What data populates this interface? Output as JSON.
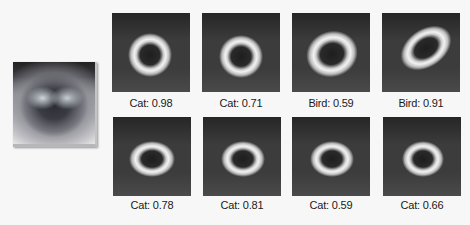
{
  "input_image": {
    "description": "cat face photo",
    "icon": "cat-photo"
  },
  "heatmaps": {
    "top_row": [
      {
        "label": "Cat: 0.98",
        "class": "Cat",
        "score": 0.98
      },
      {
        "label": "Cat: 0.71",
        "class": "Cat",
        "score": 0.71
      },
      {
        "label": "Bird: 0.59",
        "class": "Bird",
        "score": 0.59
      },
      {
        "label": "Bird: 0.91",
        "class": "Bird",
        "score": 0.91
      }
    ],
    "bottom_row": [
      {
        "label": "Cat: 0.78",
        "class": "Cat",
        "score": 0.78
      },
      {
        "label": "Cat: 0.81",
        "class": "Cat",
        "score": 0.81
      },
      {
        "label": "Cat: 0.59",
        "class": "Cat",
        "score": 0.59
      },
      {
        "label": "Cat: 0.66",
        "class": "Cat",
        "score": 0.66
      }
    ]
  },
  "colors": {
    "background": "#f7f7f7",
    "tile_background": "#3c3c3c",
    "label_text": "#1a1a1a"
  }
}
